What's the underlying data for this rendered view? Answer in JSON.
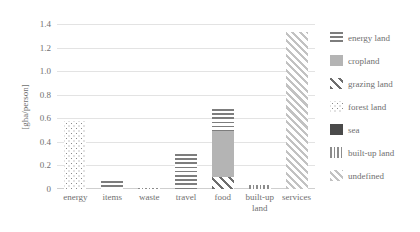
{
  "chart_data": {
    "type": "bar",
    "title": "",
    "subtitle": "",
    "xlabel": "",
    "ylabel": "[gha/person]",
    "ylim": [
      0,
      1.4
    ],
    "yticks": [
      "0",
      "0.2",
      "0.4",
      "0.6",
      "0.8",
      "1.0",
      "1.2",
      "1.4"
    ],
    "ytick_values": [
      0,
      0.2,
      0.4,
      0.6,
      0.8,
      1.0,
      1.2,
      1.4
    ],
    "grid": true,
    "stacked": true,
    "legend_position": "right",
    "categories": [
      "energy",
      "items",
      "waste",
      "travel",
      "food",
      "built-up land",
      "services"
    ],
    "series": [
      {
        "name": "energy land",
        "pattern": "pat-energy",
        "values": [
          0,
          0.07,
          0,
          0.3,
          0.19,
          0,
          0
        ]
      },
      {
        "name": "cropland",
        "pattern": "pat-cropland",
        "values": [
          0,
          0,
          0,
          0,
          0.39,
          0,
          0
        ]
      },
      {
        "name": "grazing land",
        "pattern": "pat-grazing",
        "values": [
          0,
          0,
          0,
          0,
          0.1,
          0,
          0
        ]
      },
      {
        "name": "forest land",
        "pattern": "pat-forest",
        "values": [
          0.58,
          0,
          0,
          0,
          0,
          0,
          0
        ]
      },
      {
        "name": "sea",
        "pattern": "pat-sea",
        "values": [
          0,
          0,
          0,
          0,
          0,
          0,
          0
        ]
      },
      {
        "name": "built-up land",
        "pattern": "pat-builtup",
        "values": [
          0,
          0,
          0.005,
          0,
          0,
          0.03,
          0
        ]
      },
      {
        "name": "undefined",
        "pattern": "pat-undefined",
        "values": [
          0,
          0,
          0,
          0,
          0,
          0,
          1.33
        ]
      }
    ],
    "totals": [
      0.58,
      0.07,
      0.005,
      0.3,
      0.68,
      0.03,
      1.33
    ]
  },
  "colors": {
    "text": "#6f6f6f",
    "grid": "#e3e3e3",
    "axis": "#cfcfcf",
    "background": "#ffffff"
  }
}
